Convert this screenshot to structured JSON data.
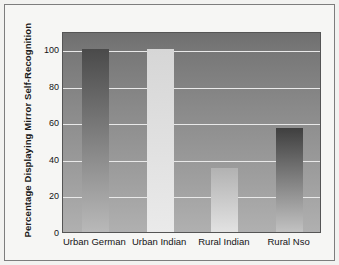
{
  "chart_data": {
    "type": "bar",
    "title": "",
    "xlabel": "",
    "ylabel": "Percentage Displaying Mirror Self-Recognition",
    "categories": [
      "Urban German",
      "Urban Indian",
      "Rural Indian",
      "Rural Nso"
    ],
    "values": [
      100,
      100,
      35,
      57
    ],
    "ylim": [
      0,
      110
    ],
    "yticks": [
      0,
      20,
      40,
      60,
      80,
      100
    ],
    "ytick_labels": [
      "0",
      "20",
      "40",
      "60",
      "80",
      "100"
    ],
    "grid": "horizontal",
    "legend": "none",
    "bar_styles": [
      {
        "name": "Urban German",
        "fill_top": "#4a4a4a",
        "fill_bottom": "#b9b9b9"
      },
      {
        "name": "Urban Indian",
        "fill_top": "#d6d6d6",
        "fill_bottom": "#eaeaea"
      },
      {
        "name": "Rural Indian",
        "fill_top": "#b2b2b2",
        "fill_bottom": "#e2e2e2"
      },
      {
        "name": "Rural Nso",
        "fill_top": "#3f3f3f",
        "fill_bottom": "#c2c2c2"
      }
    ],
    "plot_background": {
      "top": "#6f6f6f",
      "bottom": "#b0b0b0"
    },
    "gridline_color": "#e9e9e9",
    "axis_color": "#555555",
    "text_color": "#141414"
  }
}
